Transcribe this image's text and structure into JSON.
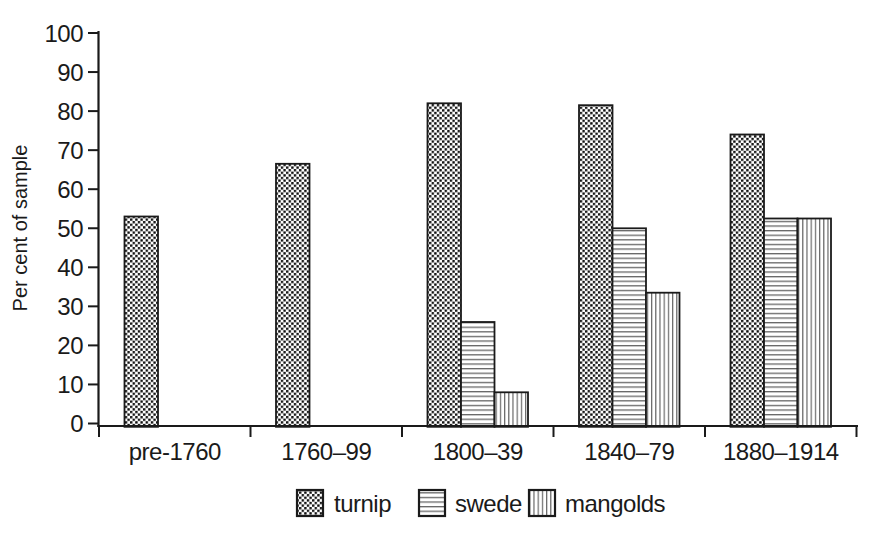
{
  "figure": {
    "background": "#ffffff",
    "ink_color": "#1a1a1a",
    "pattern_line_color": "#666666",
    "pattern_dot_color": "#111111"
  },
  "chart_data": {
    "type": "bar",
    "title": "",
    "xlabel": "",
    "ylabel": "Per cent of sample",
    "ylim": [
      0,
      100
    ],
    "ytick_step": 10,
    "grid": false,
    "legend_position": "bottom-center",
    "categories": [
      "pre-1760",
      "1760–99",
      "1800–39",
      "1840–79",
      "1880–1914"
    ],
    "series": [
      {
        "name": "turnip",
        "pattern": "dots",
        "values": [
          53,
          66.5,
          82,
          81.5,
          74
        ]
      },
      {
        "name": "swede",
        "pattern": "horizontal-lines",
        "values": [
          0,
          0,
          26,
          50,
          52.5
        ]
      },
      {
        "name": "mangolds",
        "pattern": "vertical-lines",
        "values": [
          0,
          0,
          8,
          33.5,
          52.5
        ]
      }
    ]
  }
}
